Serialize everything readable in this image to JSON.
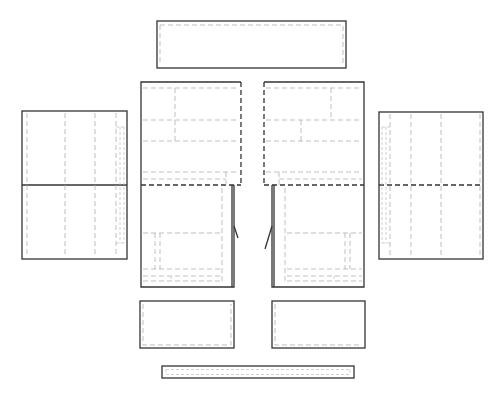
{
  "diagram": {
    "title": "",
    "colors": {
      "background": "#ffffff",
      "outline": "#333333",
      "hidden_line": "#b5b5b5",
      "fold_line": "#333333"
    },
    "panels": [
      {
        "id": "top-panel",
        "label": ""
      },
      {
        "id": "left-side-panel",
        "label": ""
      },
      {
        "id": "left-door-panel",
        "label": ""
      },
      {
        "id": "right-door-panel",
        "label": ""
      },
      {
        "id": "right-side-panel",
        "label": ""
      },
      {
        "id": "left-drawer-front",
        "label": ""
      },
      {
        "id": "right-drawer-front",
        "label": ""
      },
      {
        "id": "base-strip",
        "label": ""
      }
    ]
  }
}
